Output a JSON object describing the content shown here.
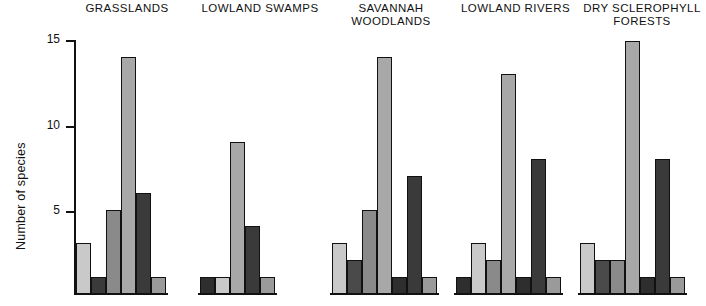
{
  "chart_data": {
    "type": "bar",
    "title": "",
    "xlabel": "",
    "ylabel": "Number of species",
    "ylim": [
      0,
      15
    ],
    "yticks": [
      5,
      10,
      15
    ],
    "grid": false,
    "legend": "none",
    "categories": [
      "GRASSLANDS",
      "LOWLAND SWAMPS",
      "SAVANNAH\nWOODLANDS",
      "LOWLAND RIVERS",
      "DRY SCLEROPHYLL\nFORESTS"
    ],
    "groups": [
      {
        "name": "GRASSLANDS",
        "values": [
          3,
          1,
          5,
          14,
          6,
          1
        ],
        "shades": [
          "#c9c9c9",
          "#3a3a3a",
          "#8a8a8a",
          "#a8a8a8",
          "#3a3a3a",
          "#9a9a9a"
        ]
      },
      {
        "name": "LOWLAND SWAMPS",
        "values": [
          1,
          1,
          9,
          4,
          1
        ],
        "shades": [
          "#2e2e2e",
          "#c9c9c9",
          "#a8a8a8",
          "#3a3a3a",
          "#9a9a9a"
        ]
      },
      {
        "name": "SAVANNAH WOODLANDS",
        "values": [
          3,
          2,
          5,
          14,
          1,
          7,
          1
        ],
        "shades": [
          "#c9c9c9",
          "#4a4a4a",
          "#8a8a8a",
          "#a8a8a8",
          "#2e2e2e",
          "#3a3a3a",
          "#9a9a9a"
        ]
      },
      {
        "name": "LOWLAND RIVERS",
        "values": [
          1,
          3,
          2,
          13,
          1,
          8,
          1
        ],
        "shades": [
          "#2e2e2e",
          "#c9c9c9",
          "#8a8a8a",
          "#a8a8a8",
          "#2e2e2e",
          "#3a3a3a",
          "#9a9a9a"
        ]
      },
      {
        "name": "DRY SCLEROPHYLL FORESTS",
        "values": [
          3,
          2,
          2,
          15,
          1,
          8,
          1
        ],
        "shades": [
          "#c9c9c9",
          "#4a4a4a",
          "#8a8a8a",
          "#a8a8a8",
          "#2e2e2e",
          "#3a3a3a",
          "#9a9a9a"
        ]
      }
    ]
  },
  "axis": {
    "y_label": "Number of species",
    "tick_15": "15",
    "tick_10": "10",
    "tick_5": "5"
  },
  "titles": {
    "g0": "GRASSLANDS",
    "g1": "LOWLAND SWAMPS",
    "g2": "SAVANNAH\nWOODLANDS",
    "g3": "LOWLAND RIVERS",
    "g4": "DRY SCLEROPHYLL\nFORESTS"
  }
}
